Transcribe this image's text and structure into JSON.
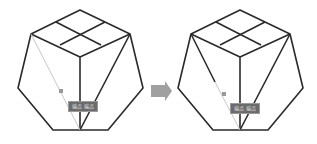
{
  "figure": {
    "colors": {
      "stroke": "#2a2a2a",
      "guide": "#c8c8c8",
      "arrow": "#a0a0a0",
      "tooltip_bg": "#6b6b6b"
    }
  },
  "left_panel": {
    "tooltip": "端点 端点"
  },
  "right_panel": {
    "tooltip": "端点 端点"
  },
  "arrow": {
    "icon": "right-arrow-icon"
  }
}
